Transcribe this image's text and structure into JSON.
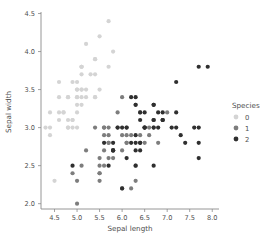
{
  "chart_data": {
    "type": "scatter",
    "title": "",
    "xlabel": "Sepal length",
    "ylabel": "Sepal width",
    "xlim": [
      4.2,
      8.15
    ],
    "ylim": [
      1.93,
      4.52
    ],
    "xticks": [
      4.5,
      5.0,
      5.5,
      6.0,
      6.5,
      7.0,
      7.5,
      8.0
    ],
    "xtick_labels": [
      "4.5",
      "5.0",
      "5.5",
      "6.0",
      "6.5",
      "7.0",
      "7.5",
      "8.0"
    ],
    "yticks": [
      2.0,
      2.5,
      3.0,
      3.5,
      4.0,
      4.5
    ],
    "ytick_labels": [
      "2.0",
      "2.5",
      "3.0",
      "3.5",
      "4.0",
      "4.5"
    ],
    "grid": false,
    "legend": {
      "title": "Species",
      "position": "right",
      "entries": [
        {
          "label": "0",
          "color": "#d4d4d4"
        },
        {
          "label": "1",
          "color": "#7d7d7d"
        },
        {
          "label": "2",
          "color": "#2f2f2f"
        }
      ]
    },
    "marker": {
      "shape": "circle",
      "radius": 2.1
    },
    "series": [
      {
        "name": "0",
        "color": "#d4d4d4",
        "points": [
          [
            5.1,
            3.5
          ],
          [
            4.9,
            3.0
          ],
          [
            4.7,
            3.2
          ],
          [
            4.6,
            3.1
          ],
          [
            5.0,
            3.6
          ],
          [
            5.4,
            3.9
          ],
          [
            4.6,
            3.4
          ],
          [
            5.0,
            3.4
          ],
          [
            4.4,
            2.9
          ],
          [
            4.9,
            3.1
          ],
          [
            5.4,
            3.7
          ],
          [
            4.8,
            3.4
          ],
          [
            4.8,
            3.0
          ],
          [
            4.3,
            3.0
          ],
          [
            5.8,
            4.0
          ],
          [
            5.7,
            4.4
          ],
          [
            5.4,
            3.9
          ],
          [
            5.1,
            3.5
          ],
          [
            5.7,
            3.8
          ],
          [
            5.1,
            3.8
          ],
          [
            5.4,
            3.4
          ],
          [
            5.1,
            3.7
          ],
          [
            4.6,
            3.6
          ],
          [
            5.1,
            3.3
          ],
          [
            4.8,
            3.4
          ],
          [
            5.0,
            3.0
          ],
          [
            5.0,
            3.4
          ],
          [
            5.2,
            3.5
          ],
          [
            5.2,
            3.4
          ],
          [
            4.7,
            3.2
          ],
          [
            4.8,
            3.1
          ],
          [
            5.4,
            3.4
          ],
          [
            5.2,
            4.1
          ],
          [
            5.5,
            4.2
          ],
          [
            4.9,
            3.1
          ],
          [
            5.0,
            3.2
          ],
          [
            5.5,
            3.5
          ],
          [
            4.9,
            3.6
          ],
          [
            4.4,
            3.0
          ],
          [
            5.1,
            3.4
          ],
          [
            5.0,
            3.5
          ],
          [
            4.5,
            2.3
          ],
          [
            4.4,
            3.2
          ],
          [
            5.0,
            3.5
          ],
          [
            5.1,
            3.8
          ],
          [
            4.8,
            3.0
          ],
          [
            5.1,
            3.8
          ],
          [
            4.6,
            3.2
          ],
          [
            5.3,
            3.7
          ],
          [
            5.0,
            3.3
          ]
        ]
      },
      {
        "name": "1",
        "color": "#7d7d7d",
        "points": [
          [
            7.0,
            3.2
          ],
          [
            6.4,
            3.2
          ],
          [
            6.9,
            3.1
          ],
          [
            5.5,
            2.3
          ],
          [
            6.5,
            2.8
          ],
          [
            5.7,
            2.8
          ],
          [
            6.3,
            3.3
          ],
          [
            4.9,
            2.4
          ],
          [
            6.6,
            2.9
          ],
          [
            5.2,
            2.7
          ],
          [
            5.0,
            2.0
          ],
          [
            5.9,
            3.0
          ],
          [
            6.0,
            2.2
          ],
          [
            6.1,
            2.9
          ],
          [
            5.6,
            2.9
          ],
          [
            6.7,
            3.1
          ],
          [
            5.6,
            3.0
          ],
          [
            5.8,
            2.7
          ],
          [
            6.2,
            2.2
          ],
          [
            5.6,
            2.5
          ],
          [
            5.9,
            3.2
          ],
          [
            6.1,
            2.8
          ],
          [
            6.3,
            2.5
          ],
          [
            6.1,
            2.8
          ],
          [
            6.4,
            2.9
          ],
          [
            6.6,
            3.0
          ],
          [
            6.8,
            2.8
          ],
          [
            6.7,
            3.0
          ],
          [
            6.0,
            2.9
          ],
          [
            5.7,
            2.6
          ],
          [
            5.5,
            2.4
          ],
          [
            5.5,
            2.4
          ],
          [
            5.8,
            2.7
          ],
          [
            6.0,
            2.7
          ],
          [
            5.4,
            3.0
          ],
          [
            6.0,
            3.4
          ],
          [
            6.7,
            3.1
          ],
          [
            6.3,
            2.3
          ],
          [
            5.6,
            3.0
          ],
          [
            5.5,
            2.5
          ],
          [
            5.5,
            2.6
          ],
          [
            6.1,
            3.0
          ],
          [
            5.8,
            2.6
          ],
          [
            5.0,
            2.3
          ],
          [
            5.6,
            2.7
          ],
          [
            5.7,
            3.0
          ],
          [
            5.7,
            2.9
          ],
          [
            6.2,
            2.9
          ],
          [
            5.1,
            2.5
          ],
          [
            5.7,
            2.8
          ]
        ]
      },
      {
        "name": "2",
        "color": "#2f2f2f",
        "points": [
          [
            6.3,
            3.3
          ],
          [
            5.8,
            2.7
          ],
          [
            7.1,
            3.0
          ],
          [
            6.3,
            2.9
          ],
          [
            6.5,
            3.0
          ],
          [
            7.6,
            3.0
          ],
          [
            4.9,
            2.5
          ],
          [
            7.3,
            2.9
          ],
          [
            6.7,
            2.5
          ],
          [
            7.2,
            3.6
          ],
          [
            6.5,
            3.2
          ],
          [
            6.4,
            2.7
          ],
          [
            6.8,
            3.0
          ],
          [
            5.7,
            2.5
          ],
          [
            5.8,
            2.8
          ],
          [
            6.4,
            3.2
          ],
          [
            6.5,
            3.0
          ],
          [
            7.7,
            3.8
          ],
          [
            7.7,
            2.6
          ],
          [
            6.0,
            2.2
          ],
          [
            6.9,
            3.2
          ],
          [
            5.6,
            2.8
          ],
          [
            7.7,
            2.8
          ],
          [
            6.3,
            2.7
          ],
          [
            6.7,
            3.3
          ],
          [
            7.2,
            3.2
          ],
          [
            6.2,
            2.8
          ],
          [
            6.1,
            3.0
          ],
          [
            6.4,
            2.8
          ],
          [
            7.2,
            3.0
          ],
          [
            7.4,
            2.8
          ],
          [
            7.9,
            3.8
          ],
          [
            6.4,
            2.8
          ],
          [
            6.3,
            2.8
          ],
          [
            6.1,
            2.6
          ],
          [
            7.7,
            3.0
          ],
          [
            6.3,
            3.4
          ],
          [
            6.4,
            3.1
          ],
          [
            6.0,
            3.0
          ],
          [
            6.9,
            3.1
          ],
          [
            6.7,
            3.1
          ],
          [
            6.9,
            3.1
          ],
          [
            5.8,
            2.7
          ],
          [
            6.8,
            3.2
          ],
          [
            6.7,
            3.3
          ],
          [
            6.7,
            3.0
          ],
          [
            6.3,
            2.5
          ],
          [
            6.5,
            3.0
          ],
          [
            6.2,
            3.4
          ],
          [
            5.9,
            3.0
          ]
        ]
      }
    ]
  },
  "geometry": {
    "plot_left": 41,
    "plot_right": 219,
    "plot_top": 12,
    "plot_bottom": 209,
    "x_pixel_per_unit": 44.0,
    "y_pixel_per_unit": 76.0,
    "legend_x": 232,
    "legend_title_y": 106
  }
}
